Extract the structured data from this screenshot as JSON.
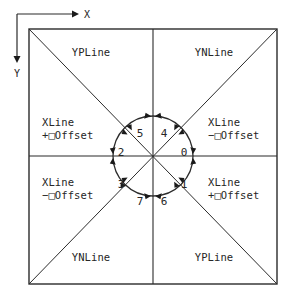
{
  "figure": {
    "background_color": "#ffffff",
    "line_color": "#2b2b2b",
    "text_color": "#262626",
    "width": 295,
    "height": 304
  },
  "axis_indicator": {
    "x_label": "X",
    "y_label": "Y",
    "origin_x": 17,
    "origin_y": 14,
    "x_arrow_end": 78,
    "y_arrow_end": 62
  },
  "frame": {
    "left": 29,
    "top": 29,
    "right": 277,
    "bottom": 284,
    "center_x": 153,
    "center_y": 156
  },
  "circle": {
    "center_x": 153,
    "center_y": 156,
    "radius": 40,
    "arrow_pair_count": 8
  },
  "octants": [
    {
      "id": "octant-0",
      "label": "0",
      "x": 184,
      "y": 152
    },
    {
      "id": "octant-1",
      "label": "1",
      "x": 184,
      "y": 184
    },
    {
      "id": "octant-6",
      "label": "6",
      "x": 163,
      "y": 201
    },
    {
      "id": "octant-7",
      "label": "7",
      "x": 139,
      "y": 201
    },
    {
      "id": "octant-3",
      "label": "3",
      "x": 120,
      "y": 184
    },
    {
      "id": "octant-2",
      "label": "2",
      "x": 120,
      "y": 152
    },
    {
      "id": "octant-5",
      "label": "5",
      "x": 139,
      "y": 133
    },
    {
      "id": "octant-4",
      "label": "4",
      "x": 163,
      "y": 133
    }
  ],
  "quadrant_labels": [
    {
      "id": "top-left",
      "text": "YPLine",
      "x": 91,
      "y": 52
    },
    {
      "id": "top-right",
      "text": "YNLine",
      "x": 214,
      "y": 52
    },
    {
      "id": "bottom-left",
      "text": "YNLine",
      "x": 91,
      "y": 257
    },
    {
      "id": "bottom-right",
      "text": "YPLine",
      "x": 214,
      "y": 257
    }
  ],
  "side_labels": [
    {
      "id": "left-upper",
      "line1": "XLine",
      "sign": "+",
      "word": "Offset",
      "x": 42,
      "y": 122
    },
    {
      "id": "right-upper",
      "line1": "XLine",
      "sign": "−",
      "word": "Offset",
      "x": 208,
      "y": 122
    },
    {
      "id": "left-lower",
      "line1": "XLine",
      "sign": "−",
      "word": "Offset",
      "x": 42,
      "y": 182
    },
    {
      "id": "right-lower",
      "line1": "XLine",
      "sign": "+",
      "word": "Offset",
      "x": 208,
      "y": 182
    }
  ]
}
